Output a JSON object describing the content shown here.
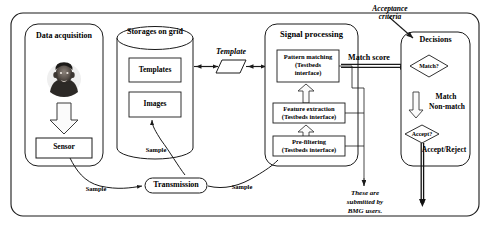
{
  "diagram": {
    "title_text": "Biometric system data flow diagram",
    "outer_container": {
      "name": "outer-frame"
    },
    "modules": {
      "data_acquisition": {
        "label": "Data acquisition",
        "subject_icon": "person-photo-icon",
        "down_arrow_icon": "down-block-arrow-icon",
        "sensor_label": "Sensor"
      },
      "storage": {
        "label": "Storages on grid",
        "templates_label": "Templates",
        "images_label": "Images"
      },
      "signal_processing": {
        "label": "Signal processing",
        "blocks": [
          {
            "line1": "Pattern matching",
            "line2": "(Testbeds",
            "line3": "interface)"
          },
          {
            "line1": "Feature extraction",
            "line2": "(Testbeds interface)",
            "line3": ""
          },
          {
            "line1": "Pre-filtering",
            "line2": "(Testbeds interface)",
            "line3": ""
          }
        ],
        "up_arrow_icon": "up-block-arrow-icon"
      },
      "decisions": {
        "label": "Decisions",
        "match_diamond": "Match?",
        "match_label": "Match",
        "non_match_label": "Non-match",
        "accept_diamond": "Accept?",
        "accept_reject_label": "Accept/Reject",
        "down_arrow_icon": "down-block-arrow-icon"
      },
      "transmission": {
        "label": "Transmission"
      }
    },
    "edge_labels": {
      "template": "Template",
      "match_score": "Match score",
      "acceptance_criteria_line1": "Acceptance",
      "acceptance_criteria_line2": "criteria",
      "sample_sensor": "Sample",
      "sample_storage": "Sample",
      "sample_signal": "Sample",
      "note_line1": "These are",
      "note_line2": "submitted by",
      "note_line3": "BMG users."
    },
    "colors": {
      "stroke": "#1a1a1a",
      "background": "#ffffff",
      "fill": "#ffffff",
      "text": "#000000",
      "arrow_fill": "#f2f2f2"
    }
  }
}
